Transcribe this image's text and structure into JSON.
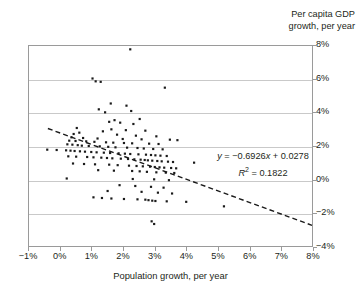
{
  "chart_data": {
    "type": "scatter",
    "title": "",
    "xlabel": "Population growth, per year",
    "ylabel": "Per capita GDP growth, per year",
    "ylabel_line1": "Per capita GDP",
    "ylabel_line2": "growth, per year",
    "xlim": [
      -1,
      8
    ],
    "ylim": [
      -4,
      8
    ],
    "xticks": [
      "-1%",
      "0%",
      "1%",
      "2%",
      "3%",
      "4%",
      "5%",
      "6%",
      "7%",
      "8%"
    ],
    "xtick_values": [
      -1,
      0,
      1,
      2,
      3,
      4,
      5,
      6,
      7,
      8
    ],
    "yticks": [
      "8%",
      "6%",
      "4%",
      "2%",
      "0%",
      "-2%",
      "-4%"
    ],
    "ytick_values": [
      8,
      6,
      4,
      2,
      0,
      -2,
      -4
    ],
    "grid": "horizontal",
    "legend": "none",
    "point_color": "#1a1a1a",
    "gridline_color": "#c9c9c9",
    "axis_color": "#9a9a9a",
    "trendline": {
      "style": "dashed",
      "color": "#1a1a1a",
      "slope": -0.6926,
      "intercept": 0.0278,
      "equation": "y = −0.6926x + 0.0278",
      "r_squared_label": "R",
      "r_squared_sup": "2",
      "r_squared_value": "= 0.1822",
      "r_squared": 0.1822,
      "x_start": -0.4,
      "x_end": 8.0,
      "y_start": 3.05,
      "y_end": -2.76
    },
    "annotations": [
      "y = −0.6926x + 0.0278",
      "R² = 0.1822"
    ],
    "points": [
      [
        2.22,
        7.8
      ],
      [
        1.02,
        6.05
      ],
      [
        1.12,
        5.88
      ],
      [
        1.28,
        5.85
      ],
      [
        3.32,
        5.5
      ],
      [
        1.6,
        4.55
      ],
      [
        2.1,
        4.42
      ],
      [
        1.22,
        4.2
      ],
      [
        2.25,
        4.1
      ],
      [
        1.42,
        4.02
      ],
      [
        2.52,
        3.62
      ],
      [
        1.72,
        3.55
      ],
      [
        1.55,
        3.45
      ],
      [
        1.9,
        3.4
      ],
      [
        2.32,
        3.32
      ],
      [
        0.52,
        3.08
      ],
      [
        1.62,
        3.0
      ],
      [
        2.08,
        2.95
      ],
      [
        2.7,
        2.92
      ],
      [
        1.35,
        2.88
      ],
      [
        0.6,
        2.8
      ],
      [
        0.42,
        2.72
      ],
      [
        1.8,
        2.68
      ],
      [
        2.4,
        2.62
      ],
      [
        3.05,
        2.58
      ],
      [
        0.35,
        2.52
      ],
      [
        0.72,
        2.48
      ],
      [
        1.18,
        2.45
      ],
      [
        1.98,
        2.42
      ],
      [
        2.58,
        2.4
      ],
      [
        3.48,
        2.38
      ],
      [
        3.72,
        2.35
      ],
      [
        0.28,
        2.32
      ],
      [
        0.48,
        2.3
      ],
      [
        0.82,
        2.28
      ],
      [
        1.08,
        2.25
      ],
      [
        1.45,
        2.22
      ],
      [
        1.68,
        2.2
      ],
      [
        2.02,
        2.18
      ],
      [
        2.28,
        2.16
      ],
      [
        2.82,
        2.14
      ],
      [
        3.12,
        2.12
      ],
      [
        0.22,
        2.1
      ],
      [
        0.38,
        2.08
      ],
      [
        0.55,
        2.05
      ],
      [
        0.68,
        2.02
      ],
      [
        0.9,
        2.0
      ],
      [
        1.25,
        1.98
      ],
      [
        1.52,
        1.95
      ],
      [
        1.75,
        1.92
      ],
      [
        2.12,
        1.9
      ],
      [
        2.45,
        1.88
      ],
      [
        2.65,
        1.85
      ],
      [
        2.95,
        1.82
      ],
      [
        3.25,
        1.8
      ],
      [
        -0.42,
        1.78
      ],
      [
        -0.12,
        1.76
      ],
      [
        0.18,
        1.74
      ],
      [
        0.32,
        1.72
      ],
      [
        0.45,
        1.7
      ],
      [
        0.62,
        1.68
      ],
      [
        0.78,
        1.66
      ],
      [
        0.98,
        1.64
      ],
      [
        1.15,
        1.62
      ],
      [
        1.38,
        1.6
      ],
      [
        1.58,
        1.58
      ],
      [
        1.85,
        1.56
      ],
      [
        2.05,
        1.54
      ],
      [
        2.22,
        1.52
      ],
      [
        2.48,
        1.5
      ],
      [
        2.72,
        1.48
      ],
      [
        2.88,
        1.46
      ],
      [
        3.02,
        1.44
      ],
      [
        3.18,
        1.42
      ],
      [
        3.38,
        1.4
      ],
      [
        0.25,
        1.38
      ],
      [
        0.5,
        1.36
      ],
      [
        0.85,
        1.34
      ],
      [
        1.05,
        1.32
      ],
      [
        1.3,
        1.3
      ],
      [
        1.48,
        1.28
      ],
      [
        1.65,
        1.26
      ],
      [
        1.92,
        1.24
      ],
      [
        2.15,
        1.22
      ],
      [
        2.35,
        1.2
      ],
      [
        2.55,
        1.18
      ],
      [
        2.68,
        1.16
      ],
      [
        2.78,
        1.14
      ],
      [
        2.92,
        1.12
      ],
      [
        3.08,
        1.1
      ],
      [
        3.22,
        1.08
      ],
      [
        3.42,
        1.06
      ],
      [
        3.58,
        1.04
      ],
      [
        4.25,
        1.0
      ],
      [
        0.4,
        0.95
      ],
      [
        0.75,
        0.92
      ],
      [
        1.1,
        0.9
      ],
      [
        1.55,
        0.88
      ],
      [
        1.82,
        0.85
      ],
      [
        2.18,
        0.82
      ],
      [
        2.42,
        0.8
      ],
      [
        2.62,
        0.78
      ],
      [
        2.85,
        0.76
      ],
      [
        3.0,
        0.74
      ],
      [
        3.15,
        0.72
      ],
      [
        3.3,
        0.7
      ],
      [
        3.52,
        0.68
      ],
      [
        3.68,
        0.66
      ],
      [
        1.2,
        0.55
      ],
      [
        1.7,
        0.52
      ],
      [
        2.28,
        0.5
      ],
      [
        2.52,
        0.48
      ],
      [
        2.75,
        0.45
      ],
      [
        3.05,
        0.42
      ],
      [
        3.35,
        0.4
      ],
      [
        3.62,
        0.38
      ],
      [
        0.2,
        0.05
      ],
      [
        2.3,
        0.02
      ],
      [
        2.98,
        0.0
      ],
      [
        3.45,
        -0.05
      ],
      [
        1.88,
        -0.35
      ],
      [
        2.38,
        -0.4
      ],
      [
        2.88,
        -0.45
      ],
      [
        3.28,
        -0.5
      ],
      [
        1.5,
        -0.7
      ],
      [
        2.58,
        -0.75
      ],
      [
        3.1,
        -0.8
      ],
      [
        3.55,
        -0.85
      ],
      [
        1.05,
        -1.08
      ],
      [
        1.32,
        -1.12
      ],
      [
        1.62,
        -1.15
      ],
      [
        2.02,
        -1.18
      ],
      [
        2.45,
        -1.2
      ],
      [
        2.7,
        -1.22
      ],
      [
        2.8,
        -1.25
      ],
      [
        2.92,
        -1.28
      ],
      [
        3.02,
        -1.3
      ],
      [
        3.38,
        -1.32
      ],
      [
        4.0,
        -1.35
      ],
      [
        5.2,
        -1.62
      ],
      [
        2.9,
        -2.52
      ],
      [
        2.98,
        -2.68
      ]
    ]
  }
}
